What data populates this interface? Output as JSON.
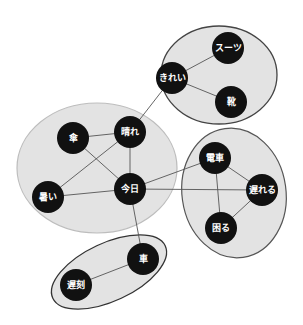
{
  "diagram": {
    "type": "word-association-network",
    "colors": {
      "node_fill": "#111111",
      "node_text": "#ffffff",
      "edge": "#555555",
      "cluster_fill": "#e3e3e3",
      "cluster_border_dark": "#444444",
      "cluster_border_light": "#bdbdbd"
    },
    "clusters": [
      {
        "id": "c-top",
        "nodes": [
          "suit",
          "kirei",
          "kutsu"
        ],
        "border": "dark"
      },
      {
        "id": "c-left",
        "nodes": [
          "kasa",
          "hare",
          "atsui",
          "kyou"
        ],
        "border": "light"
      },
      {
        "id": "c-right",
        "nodes": [
          "densha",
          "okureru",
          "komaru"
        ],
        "border": "dark"
      },
      {
        "id": "c-bottom",
        "nodes": [
          "kuruma",
          "chikoku"
        ],
        "border": "dark"
      }
    ],
    "nodes": {
      "suit": {
        "label": "スーツ"
      },
      "kirei": {
        "label": "きれい"
      },
      "kutsu": {
        "label": "靴"
      },
      "kasa": {
        "label": "傘"
      },
      "hare": {
        "label": "晴れ"
      },
      "atsui": {
        "label": "暑い"
      },
      "kyou": {
        "label": "今日"
      },
      "densha": {
        "label": "電車"
      },
      "okureru": {
        "label": "遅れる"
      },
      "komaru": {
        "label": "困る"
      },
      "kuruma": {
        "label": "車"
      },
      "chikoku": {
        "label": "遅刻"
      }
    },
    "edges": [
      [
        "kirei",
        "suit"
      ],
      [
        "kirei",
        "kutsu"
      ],
      [
        "kirei",
        "hare"
      ],
      [
        "kasa",
        "hare"
      ],
      [
        "kasa",
        "kyou"
      ],
      [
        "hare",
        "atsui"
      ],
      [
        "hare",
        "kyou"
      ],
      [
        "atsui",
        "kyou"
      ],
      [
        "kyou",
        "densha"
      ],
      [
        "kyou",
        "okureru"
      ],
      [
        "kyou",
        "kuruma"
      ],
      [
        "densha",
        "okureru"
      ],
      [
        "densha",
        "komaru"
      ],
      [
        "okureru",
        "komaru"
      ],
      [
        "kuruma",
        "chikoku"
      ]
    ]
  }
}
